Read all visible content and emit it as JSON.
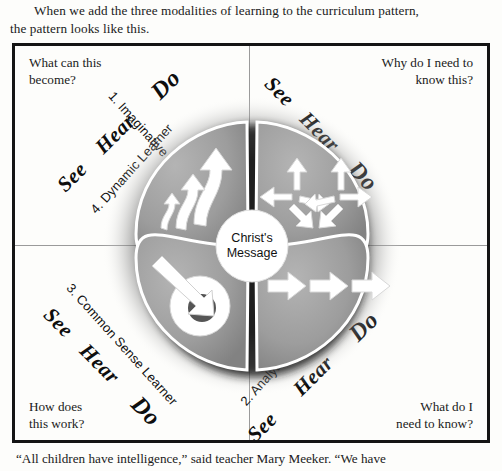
{
  "intro": {
    "line1": "When we add the three modalities of learning to the curriculum pattern,",
    "line2": "the pattern looks like this."
  },
  "figure": {
    "center": {
      "line1": "Christ's",
      "line2": "Message"
    },
    "modality_words": {
      "see": "See",
      "hear": "Hear",
      "do": "Do"
    },
    "quadrants": [
      {
        "id": "top-left",
        "question": "What can this\nbecome?",
        "learner_label": "4. Dynamic Learner",
        "icon": "ascending-arrows-icon",
        "modalities": [
          "See",
          "Hear",
          "Do"
        ]
      },
      {
        "id": "top-right",
        "question": "Why do I need to\nknow this?",
        "learner_label": "1. Imaginative Learner",
        "icon": "multidirectional-arrows-icon",
        "modalities": [
          "See",
          "Hear",
          "Do"
        ]
      },
      {
        "id": "bottom-left",
        "question": "How does\nthis work?",
        "learner_label": "3. Common Sense Learner",
        "icon": "arrow-to-target-icon",
        "modalities": [
          "See",
          "Hear",
          "Do"
        ]
      },
      {
        "id": "bottom-right",
        "question": "What do I\nneed to know?",
        "learner_label": "2. Analytic Learner",
        "icon": "sequential-arrows-icon",
        "modalities": [
          "See",
          "Hear",
          "Do"
        ]
      }
    ],
    "colors": {
      "petal_fill": "#9d9d9d",
      "petal_shadow": "#2b2b2b",
      "arrow_fill": "#ffffff",
      "center_fill": "#ffffff",
      "target_inner": "#555555",
      "frame_border": "#141414",
      "divider": "#9a9a9a"
    }
  },
  "caption": {
    "text": "“All children have intelligence,” said teacher Mary Meeker. “We have"
  }
}
